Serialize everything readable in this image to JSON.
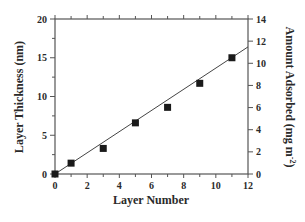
{
  "chart_data": {
    "type": "scatter",
    "title": "",
    "xlabel": "Layer Number",
    "ylabel": "Layer Thickness (nm)",
    "y2label": "Amount Adsorbed (mg m",
    "y2label_sup": "-2",
    "y2label_close": ")",
    "xlim": [
      0,
      12
    ],
    "ylim": [
      0,
      20
    ],
    "y2lim": [
      0,
      14
    ],
    "xticks": [
      0,
      2,
      4,
      6,
      8,
      10,
      12
    ],
    "yticks": [
      0,
      5,
      10,
      15,
      20
    ],
    "y2ticks": [
      0,
      2,
      4,
      6,
      8,
      10,
      12,
      14
    ],
    "grid": false,
    "legend": null,
    "series": [
      {
        "name": "Layer Thickness",
        "marker": "square",
        "x": [
          0,
          1,
          3,
          5,
          7,
          9,
          11
        ],
        "y": [
          0,
          1.4,
          3.3,
          6.6,
          8.6,
          11.7,
          15.0
        ]
      }
    ],
    "fit_line": {
      "x": [
        0,
        12
      ],
      "y": [
        0,
        16.4
      ]
    }
  },
  "colors": {
    "axis": "#555555",
    "marker": "#1a1a1a",
    "line": "#444444",
    "text": "#2a2a2a"
  }
}
